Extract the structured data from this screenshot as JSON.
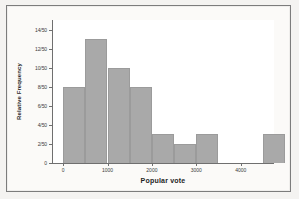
{
  "figure": {
    "border_color": "#7c7c7c",
    "page_background": "#f4f3f1",
    "plot_background": "#ffffff",
    "bar_color": "#a9a9a9"
  },
  "chart_data": {
    "type": "bar",
    "title": "",
    "subtitle": "",
    "xlabel": "Popular vote",
    "ylabel": "Relative Frequency",
    "grid": false,
    "legend": null,
    "xlim": [
      -250,
      4750
    ],
    "ylim": [
      0,
      15
    ],
    "bin_width": 500,
    "denominator": 50,
    "x_tick_values": [
      0,
      1000,
      2000,
      3000,
      4000
    ],
    "x_tick_labels": [
      "0",
      "1000",
      "2000",
      "3000",
      "4000"
    ],
    "y_tick_values": [
      0,
      2,
      4,
      6,
      8,
      10,
      12,
      14
    ],
    "y_tick_labels": [
      "0",
      "2/50",
      "4/50",
      "6/50",
      "8/50",
      "10/50",
      "12/50",
      "14/50"
    ],
    "bins": [
      {
        "start": 0,
        "end": 500,
        "count": 8,
        "label": "0-500"
      },
      {
        "start": 500,
        "end": 1000,
        "count": 13,
        "label": "500-1000"
      },
      {
        "start": 1000,
        "end": 1500,
        "count": 10,
        "label": "1000-1500"
      },
      {
        "start": 1500,
        "end": 2000,
        "count": 8,
        "label": "1500-2000"
      },
      {
        "start": 2000,
        "end": 2500,
        "count": 3,
        "label": "2000-2500"
      },
      {
        "start": 2500,
        "end": 3000,
        "count": 2,
        "label": "2500-3000"
      },
      {
        "start": 3000,
        "end": 3500,
        "count": 3,
        "label": "3000-3500"
      },
      {
        "start": 3500,
        "end": 4000,
        "count": 0,
        "label": "3500-4000"
      },
      {
        "start": 4000,
        "end": 4500,
        "count": 0,
        "label": "4000-4500"
      },
      {
        "start": 4500,
        "end": 5000,
        "count": 3,
        "label": "4500-5000"
      }
    ],
    "categories": [
      "0-500",
      "500-1000",
      "1000-1500",
      "1500-2000",
      "2000-2500",
      "2500-3000",
      "3000-3500",
      "3500-4000",
      "4000-4500",
      "4500-5000"
    ],
    "values": [
      8,
      13,
      10,
      8,
      3,
      2,
      3,
      0,
      0,
      3
    ]
  }
}
